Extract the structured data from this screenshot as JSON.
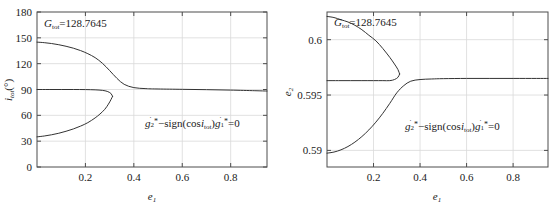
{
  "figure": {
    "background": "#ffffff",
    "axis_color": "#4d4d4d",
    "grid_color": "#d9d9d9",
    "curve_color": "#333333"
  },
  "chart_data": [
    {
      "type": "line",
      "panel": "left",
      "title": "",
      "xlabel": "e1",
      "xlabel_base": "e",
      "xlabel_sub": "1",
      "ylabel_base": "i",
      "ylabel_sub": "tot",
      "ylabel_units": "(°)",
      "ylabel": "i_tot (°)",
      "xlim": [
        0,
        0.95
      ],
      "ylim": [
        0,
        180
      ],
      "xticks": [
        0.2,
        0.4,
        0.6,
        0.8
      ],
      "xtick_labels": [
        "0.2",
        "0.4",
        "0.6",
        "0.8"
      ],
      "yticks": [
        0,
        30,
        60,
        90,
        120,
        150,
        180
      ],
      "ytick_labels": [
        "0",
        "30",
        "60",
        "90",
        "120",
        "150",
        "180"
      ],
      "grid": true,
      "legend": "none",
      "annotations": [
        {
          "name": "gtot-label",
          "text": "G_tot=128.7645",
          "base": "G",
          "sub": "tot",
          "value": "=128.7645",
          "x": 0.05,
          "y": 170
        },
        {
          "name": "equation-label",
          "text": "ġ2*−sign(cos i_tot)ġ1*=0",
          "x": 0.45,
          "y": 48
        }
      ],
      "series": [
        {
          "name": "upper-branch",
          "x": [
            0.0,
            0.03,
            0.06,
            0.09,
            0.12,
            0.15,
            0.18,
            0.21,
            0.24,
            0.27,
            0.3,
            0.33,
            0.36,
            0.4,
            0.45,
            0.5,
            0.6,
            0.7,
            0.8,
            0.9,
            0.95
          ],
          "values": [
            145.0,
            144.4,
            143.4,
            142.0,
            140.2,
            138.0,
            135.2,
            131.6,
            127.0,
            120.5,
            112.0,
            103.0,
            96.0,
            92.2,
            91.0,
            90.6,
            90.2,
            89.8,
            89.3,
            88.6,
            88.2
          ]
        },
        {
          "name": "middle-branch",
          "x": [
            0.0,
            0.05,
            0.1,
            0.15,
            0.2,
            0.24,
            0.27,
            0.29,
            0.305,
            0.312
          ],
          "values": [
            90.0,
            90.0,
            90.0,
            90.0,
            89.9,
            89.6,
            89.0,
            87.8,
            85.5,
            82.0
          ]
        },
        {
          "name": "lower-branch",
          "x": [
            0.312,
            0.305,
            0.295,
            0.28,
            0.26,
            0.24,
            0.21,
            0.18,
            0.15,
            0.12,
            0.09,
            0.06,
            0.03,
            0.0
          ],
          "values": [
            82.0,
            78.0,
            73.0,
            67.0,
            61.5,
            57.0,
            51.5,
            47.5,
            44.2,
            41.5,
            39.2,
            37.4,
            36.0,
            35.0
          ]
        }
      ]
    },
    {
      "type": "line",
      "panel": "right",
      "title": "",
      "xlabel": "e1",
      "xlabel_base": "e",
      "xlabel_sub": "1",
      "ylabel_base": "e",
      "ylabel_sub": "2",
      "ylabel": "e_2",
      "xlim": [
        0,
        0.95
      ],
      "ylim": [
        0.5885,
        0.6025
      ],
      "xticks": [
        0.2,
        0.4,
        0.6,
        0.8
      ],
      "xtick_labels": [
        "0.2",
        "0.4",
        "0.6",
        "0.8"
      ],
      "yticks": [
        0.59,
        0.595,
        0.6
      ],
      "ytick_labels": [
        "0.59",
        "0.595",
        "0.6"
      ],
      "grid": true,
      "legend": "none",
      "annotations": [
        {
          "name": "gtot-label",
          "text": "G_tot=128.7645",
          "base": "G",
          "sub": "tot",
          "value": "=128.7645",
          "x": 0.06,
          "y": 0.6018
        },
        {
          "name": "equation-label",
          "text": "ġ2*−sign(cos i_tot)ġ1*=0",
          "x": 0.46,
          "y": 0.5918
        }
      ],
      "series": [
        {
          "name": "upper-branch",
          "x": [
            0.0,
            0.03,
            0.06,
            0.09,
            0.12,
            0.15,
            0.18,
            0.21,
            0.24,
            0.27,
            0.29,
            0.305,
            0.312
          ],
          "values": [
            0.6021,
            0.602,
            0.6018,
            0.6016,
            0.6013,
            0.6009,
            0.6004,
            0.5999,
            0.5992,
            0.5984,
            0.5978,
            0.5973,
            0.5969
          ]
        },
        {
          "name": "middle-branch",
          "x": [
            0.312,
            0.305,
            0.29,
            0.27,
            0.24,
            0.2,
            0.15,
            0.1,
            0.05,
            0.0
          ],
          "values": [
            0.5969,
            0.5966,
            0.5964,
            0.5963,
            0.5963,
            0.5963,
            0.5963,
            0.5963,
            0.5963,
            0.5963
          ]
        },
        {
          "name": "lower-branch",
          "x": [
            0.0,
            0.03,
            0.06,
            0.09,
            0.12,
            0.15,
            0.18,
            0.21,
            0.24,
            0.27,
            0.3,
            0.33,
            0.36,
            0.4,
            0.45,
            0.5,
            0.6,
            0.7,
            0.8,
            0.9,
            0.95
          ],
          "values": [
            0.58975,
            0.58985,
            0.59005,
            0.59035,
            0.59075,
            0.59125,
            0.59185,
            0.59255,
            0.59335,
            0.59425,
            0.5952,
            0.59585,
            0.59625,
            0.5964,
            0.59645,
            0.59648,
            0.5965,
            0.5965,
            0.5965,
            0.5965,
            0.5965
          ]
        }
      ]
    }
  ]
}
